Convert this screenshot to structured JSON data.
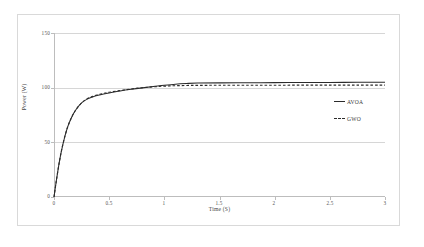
{
  "figure": {
    "background_color": "#ffffff",
    "border_color": "#d9d9d9",
    "grid_color": "#d6d6d6",
    "line_color": "#2b2b2b"
  },
  "chart_data": {
    "type": "line",
    "title": "",
    "xlabel": "Time (S)",
    "ylabel": "Power (W)",
    "xlim": [
      0,
      3
    ],
    "ylim": [
      0,
      150
    ],
    "xticks": [
      "0",
      "0.5",
      "1",
      "1.5",
      "2",
      "2.5",
      "3"
    ],
    "xtick_values": [
      0,
      0.5,
      1,
      1.5,
      2,
      2.5,
      3
    ],
    "yticks": [
      "0",
      "50",
      "100",
      "150"
    ],
    "ytick_values": [
      0,
      50,
      100,
      150
    ],
    "grid": "horizontal",
    "legend_position": "center-right",
    "series": [
      {
        "name": "AVOA",
        "style": "solid",
        "color": "#2b2b2b",
        "x": [
          0,
          0.02,
          0.05,
          0.08,
          0.12,
          0.16,
          0.2,
          0.25,
          0.3,
          0.35,
          0.4,
          0.45,
          0.5,
          0.6,
          0.7,
          0.8,
          0.9,
          1.0,
          1.1,
          1.2,
          1.3,
          1.5,
          1.75,
          2.0,
          2.25,
          2.5,
          2.75,
          3.0
        ],
        "values": [
          0,
          14,
          33,
          48,
          63,
          73,
          80,
          86,
          89.5,
          91.5,
          93,
          94.2,
          95.2,
          97,
          98.5,
          99.8,
          101,
          102.2,
          103.2,
          103.8,
          104.2,
          104.4,
          104.5,
          104.6,
          104.7,
          104.8,
          104.9,
          105
        ]
      },
      {
        "name": "GWO",
        "style": "dashed",
        "color": "#2b2b2b",
        "x": [
          0,
          0.02,
          0.05,
          0.08,
          0.12,
          0.16,
          0.2,
          0.25,
          0.3,
          0.35,
          0.4,
          0.45,
          0.5,
          0.6,
          0.7,
          0.8,
          0.9,
          1.0,
          1.1,
          1.2,
          1.3,
          1.5,
          1.75,
          2.0,
          2.25,
          2.5,
          2.75,
          3.0
        ],
        "values": [
          0,
          14,
          33,
          48,
          63,
          73,
          80,
          86,
          89.8,
          92,
          93.5,
          94.8,
          95.8,
          97.4,
          98.8,
          99.9,
          100.8,
          101.4,
          101.8,
          102.0,
          102.1,
          102.2,
          102.2,
          102.2,
          102.3,
          102.3,
          102.3,
          102.3
        ]
      }
    ],
    "legend": [
      {
        "label": "AVOA",
        "style": "solid"
      },
      {
        "label": "GWO",
        "style": "dashed"
      }
    ]
  }
}
